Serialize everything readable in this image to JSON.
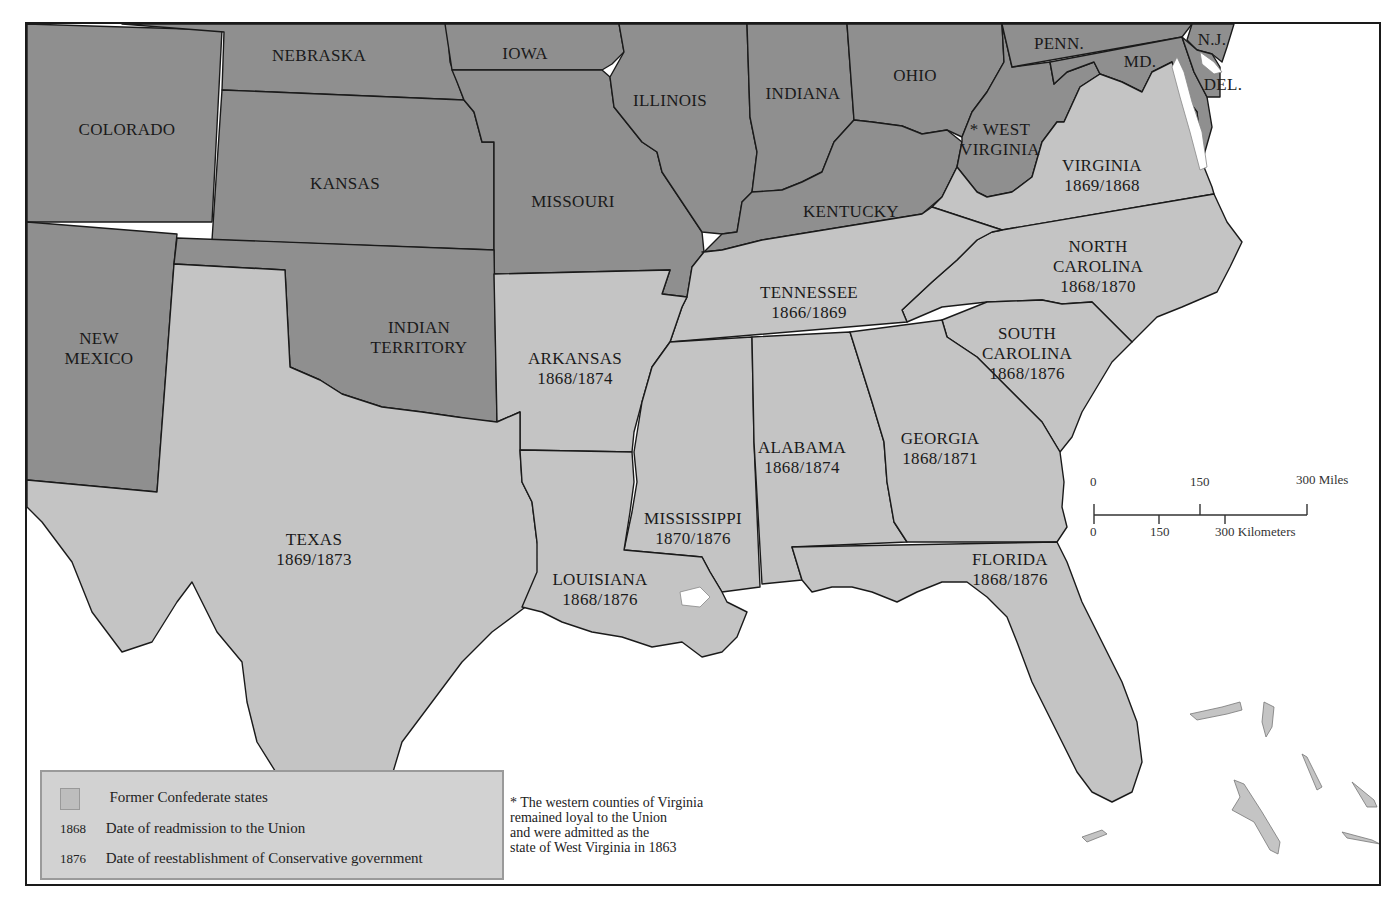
{
  "map": {
    "union_color": "#8f8f8f",
    "confederate_color": "#c4c4c4",
    "water_color": "#ffffff",
    "union_states": [
      {
        "id": "colorado",
        "name": "COLORADO"
      },
      {
        "id": "nebraska",
        "name": "NEBRASKA"
      },
      {
        "id": "kansas",
        "name": "KANSAS"
      },
      {
        "id": "iowa",
        "name": "IOWA"
      },
      {
        "id": "missouri",
        "name": "MISSOURI"
      },
      {
        "id": "illinois",
        "name": "ILLINOIS"
      },
      {
        "id": "indiana",
        "name": "INDIANA"
      },
      {
        "id": "ohio",
        "name": "OHIO"
      },
      {
        "id": "kentucky",
        "name": "KENTUCKY"
      },
      {
        "id": "west_virginia",
        "name_line1": "* WEST",
        "name_line2": "VIRGINIA"
      },
      {
        "id": "penn",
        "name": "PENN."
      },
      {
        "id": "md",
        "name": "MD."
      },
      {
        "id": "nj",
        "name": "N.J."
      },
      {
        "id": "del",
        "name": "DEL."
      },
      {
        "id": "new_mexico",
        "name_line1": "NEW",
        "name_line2": "MEXICO"
      },
      {
        "id": "indian_territory",
        "name_line1": "INDIAN",
        "name_line2": "TERRITORY"
      }
    ],
    "confederate_states": [
      {
        "id": "virginia",
        "name": "VIRGINIA",
        "readmission": "1869",
        "conservative": "1868",
        "dates": "1869/1868"
      },
      {
        "id": "north_carolina",
        "name_line1": "NORTH",
        "name_line2": "CAROLINA",
        "readmission": "1868",
        "conservative": "1870",
        "dates": "1868/1870"
      },
      {
        "id": "tennessee",
        "name": "TENNESSEE",
        "readmission": "1866",
        "conservative": "1869",
        "dates": "1866/1869"
      },
      {
        "id": "south_carolina",
        "name_line1": "SOUTH",
        "name_line2": "CAROLINA",
        "readmission": "1868",
        "conservative": "1876",
        "dates": "1868/1876"
      },
      {
        "id": "arkansas",
        "name": "ARKANSAS",
        "readmission": "1868",
        "conservative": "1874",
        "dates": "1868/1874"
      },
      {
        "id": "alabama",
        "name": "ALABAMA",
        "readmission": "1868",
        "conservative": "1874",
        "dates": "1868/1874"
      },
      {
        "id": "georgia",
        "name": "GEORGIA",
        "readmission": "1868",
        "conservative": "1871",
        "dates": "1868/1871"
      },
      {
        "id": "mississippi",
        "name": "MISSISSIPPI",
        "readmission": "1870",
        "conservative": "1876",
        "dates": "1870/1876"
      },
      {
        "id": "texas",
        "name": "TEXAS",
        "readmission": "1869",
        "conservative": "1873",
        "dates": "1869/1873"
      },
      {
        "id": "louisiana",
        "name": "LOUISIANA",
        "readmission": "1868",
        "conservative": "1876",
        "dates": "1868/1876"
      },
      {
        "id": "florida",
        "name": "FLORIDA",
        "readmission": "1868",
        "conservative": "1876",
        "dates": "1868/1876"
      }
    ]
  },
  "scale_bar": {
    "miles_ticks": [
      "0",
      "150",
      "300 Miles"
    ],
    "km_ticks": [
      "0",
      "150",
      "300 Kilometers"
    ]
  },
  "legend": {
    "items": [
      {
        "key": "",
        "swatch": true,
        "label": "Former Confederate states"
      },
      {
        "key": "1868",
        "swatch": false,
        "label": "Date of readmission to the Union"
      },
      {
        "key": "1876",
        "swatch": false,
        "label": "Date of reestablishment of Conservative government"
      }
    ]
  },
  "footnote": {
    "lines": [
      "* The western counties of Virginia",
      "remained loyal to the Union",
      "and were admitted as the",
      "state of West Virginia in 1863"
    ]
  }
}
